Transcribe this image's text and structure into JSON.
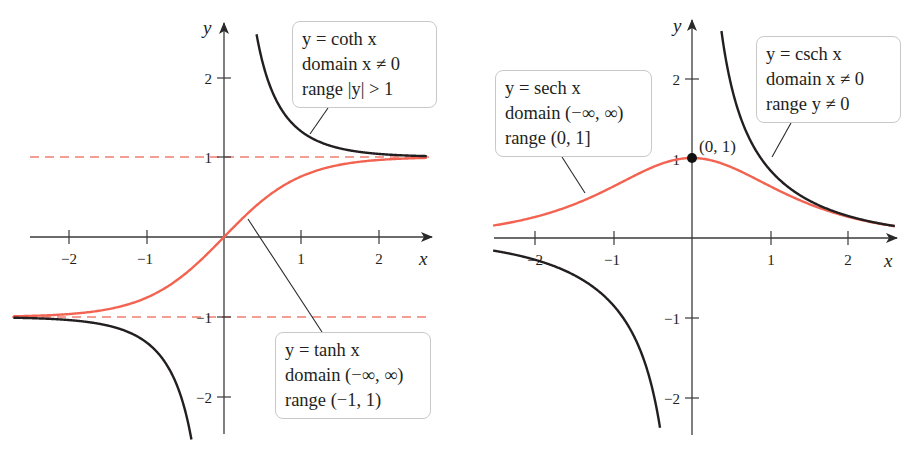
{
  "chart_data": [
    {
      "type": "line",
      "title": "",
      "xlabel": "x",
      "ylabel": "y",
      "xlim": [
        -2.5,
        2.6
      ],
      "ylim": [
        -2.5,
        2.7
      ],
      "x_ticks": [
        -2,
        -1,
        1,
        2
      ],
      "y_ticks": [
        -2,
        -1,
        1,
        2
      ],
      "grid": false,
      "asymptotes": [
        {
          "type": "horizontal",
          "y": 1,
          "style": "dashed",
          "color": "#f06a5e"
        },
        {
          "type": "horizontal",
          "y": -1,
          "style": "dashed",
          "color": "#f06a5e"
        }
      ],
      "series": [
        {
          "name": "y = tanh x",
          "color": "#f26451",
          "function": "tanh",
          "domain": "(-∞, ∞)",
          "range": "(-1, 1)",
          "x": [
            -2.5,
            -2,
            -1.5,
            -1,
            -0.5,
            0,
            0.5,
            1,
            1.5,
            2,
            2.5
          ],
          "values": [
            -0.987,
            -0.964,
            -0.905,
            -0.762,
            -0.462,
            0,
            0.462,
            0.762,
            0.905,
            0.964,
            0.987
          ]
        },
        {
          "name": "y = coth x",
          "color": "#231f20",
          "function": "coth",
          "domain": "x ≠ 0",
          "range": "|y| > 1",
          "x": [
            -2.5,
            -2,
            -1.5,
            -1,
            -0.6,
            -0.42,
            0.42,
            0.6,
            1,
            1.5,
            2,
            2.5
          ],
          "values": [
            -1.013,
            -1.037,
            -1.105,
            -1.313,
            -1.862,
            -2.52,
            2.52,
            1.862,
            1.313,
            1.105,
            1.037,
            1.013
          ]
        }
      ],
      "annotations": [
        {
          "text": [
            "y = coth x",
            "domain x ≠ 0",
            "range |y| > 1"
          ],
          "points_to": "coth x branch near x ≈ 1.1"
        },
        {
          "text": [
            "y = tanh x",
            "domain (−∞, ∞)",
            "range (−1, 1)"
          ],
          "points_to": "tanh x near x ≈ 0.3"
        }
      ]
    },
    {
      "type": "line",
      "title": "",
      "xlabel": "x",
      "ylabel": "y",
      "xlim": [
        -2.5,
        2.6
      ],
      "ylim": [
        -2.5,
        2.75
      ],
      "x_ticks": [
        -2,
        -1,
        1,
        2
      ],
      "y_ticks": [
        -2,
        -1,
        1,
        2
      ],
      "grid": false,
      "series": [
        {
          "name": "y = sech x",
          "color": "#f26451",
          "function": "sech",
          "domain": "(-∞, ∞)",
          "range": "(0, 1]",
          "x": [
            -2.5,
            -2,
            -1.5,
            -1,
            -0.5,
            0,
            0.5,
            1,
            1.5,
            2,
            2.5
          ],
          "values": [
            0.163,
            0.266,
            0.425,
            0.648,
            0.887,
            1,
            0.887,
            0.648,
            0.425,
            0.266,
            0.163
          ]
        },
        {
          "name": "y = csch x",
          "color": "#231f20",
          "function": "csch",
          "domain": "x ≠ 0",
          "range": "y ≠ 0",
          "x": [
            -2.5,
            -2,
            -1.5,
            -1,
            -0.6,
            -0.42,
            0.38,
            0.6,
            1,
            1.5,
            2,
            2.5
          ],
          "values": [
            -0.165,
            -0.276,
            -0.47,
            -0.851,
            -1.569,
            -2.31,
            2.54,
            1.569,
            0.851,
            0.47,
            0.276,
            0.165
          ]
        }
      ],
      "points": [
        {
          "x": 0,
          "y": 1,
          "label": "(0, 1)"
        }
      ],
      "annotations": [
        {
          "text": [
            "y = sech x",
            "domain (−∞, ∞)",
            "range (0, 1]"
          ],
          "points_to": "sech x near x ≈ −1.4"
        },
        {
          "text": [
            "y = csch x",
            "domain x ≠ 0",
            "range y ≠ 0"
          ],
          "points_to": "csch x near x ≈ 1.0"
        }
      ]
    }
  ],
  "left_plot": {
    "axis_x_label": "x",
    "axis_y_label": "y",
    "x_tick_labels": [
      "−2",
      "−1",
      "1",
      "2"
    ],
    "y_tick_labels": [
      "2",
      "1",
      "−1",
      "−2"
    ],
    "coth_box": {
      "line1": "y = coth x",
      "line2": "domain x ≠ 0",
      "line3": "range |y| > 1"
    },
    "tanh_box": {
      "line1": "y = tanh x",
      "line2": "domain (−∞, ∞)",
      "line3": "range (−1, 1)"
    }
  },
  "right_plot": {
    "axis_x_label": "x",
    "axis_y_label": "y",
    "x_tick_labels": [
      "−2",
      "−1",
      "1",
      "2"
    ],
    "y_tick_labels": [
      "2",
      "1",
      "−1",
      "−2"
    ],
    "point_label": "(0, 1)",
    "sech_box": {
      "line1": "y = sech x",
      "line2": "domain (−∞, ∞)",
      "line3": "range (0, 1]"
    },
    "csch_box": {
      "line1": "y = csch x",
      "line2": "domain x ≠ 0",
      "line3": "range y ≠ 0"
    }
  },
  "colors": {
    "curve_red": "#f26451",
    "asymptote_red": "#f07e72",
    "curve_black": "#231f20",
    "axis": "#3a3a3a",
    "box_border": "#c9c9c9"
  }
}
